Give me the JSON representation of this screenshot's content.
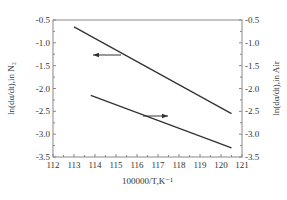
{
  "chart_data": {
    "type": "line",
    "title": "",
    "xlabel": "100000/T,K⁻¹",
    "ylabel_left": "ln(dα/dt),in N₂",
    "ylabel_right": "ln(dα/dt),in Air",
    "xlim": [
      112,
      121
    ],
    "ylim_left": [
      -3.5,
      -0.5
    ],
    "ylim_right": [
      -3.5,
      -0.5
    ],
    "x_ticks": [
      "112",
      "113",
      "114",
      "115",
      "116",
      "117",
      "118",
      "119",
      "120",
      "121"
    ],
    "y_ticks_left": [
      "-0.5",
      "-1.0",
      "-1.5",
      "-2.0",
      "-2.5",
      "-3.0",
      "-3.5"
    ],
    "y_ticks_right": [
      "-0.5",
      "-1.0",
      "-1.5",
      "-2.0",
      "-2.5",
      "-3.0",
      "-3.5"
    ],
    "grid": false,
    "legend": null,
    "series": [
      {
        "name": "in N2",
        "axis": "left",
        "x": [
          113.0,
          120.5
        ],
        "y": [
          -0.65,
          -2.55
        ],
        "annotation": "arrow pointing left (to left axis)"
      },
      {
        "name": "in Air",
        "axis": "right",
        "x": [
          113.8,
          120.5
        ],
        "y": [
          -2.15,
          -3.3
        ],
        "annotation": "arrow pointing right (to right axis)"
      }
    ]
  }
}
